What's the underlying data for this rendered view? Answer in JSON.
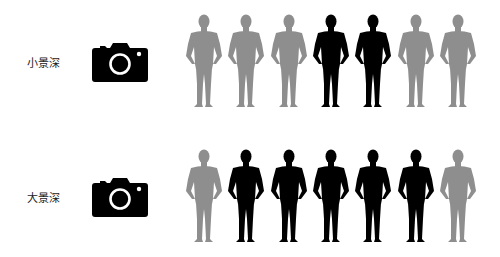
{
  "colors": {
    "in_focus": "#000000",
    "out_of_focus": "#8e8e8e",
    "camera": "#000000",
    "label": "#222222"
  },
  "rows": [
    {
      "label": "小景深",
      "camera_icon": "camera-icon",
      "figures": [
        "blur",
        "blur",
        "blur",
        "sharp",
        "sharp",
        "blur",
        "blur"
      ]
    },
    {
      "label": "大景深",
      "camera_icon": "camera-icon",
      "figures": [
        "blur",
        "sharp",
        "sharp",
        "sharp",
        "sharp",
        "sharp",
        "blur"
      ]
    }
  ]
}
